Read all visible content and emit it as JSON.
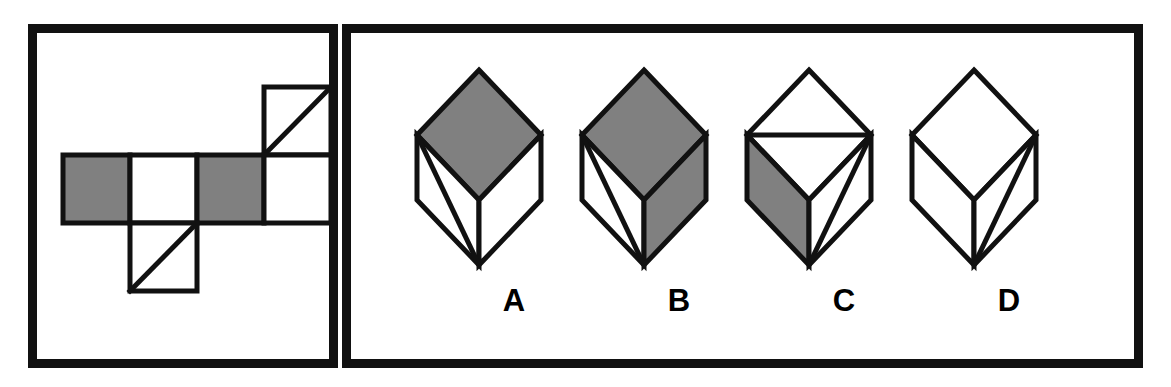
{
  "figure": {
    "type": "cube-folding-puzzle",
    "colors": {
      "ink": "#111111",
      "shaded_face": "#808080",
      "blank_face": "#ffffff",
      "background": "#ffffff"
    }
  },
  "left_panel": {
    "name": "cube-net",
    "grid": {
      "columns": 4,
      "rows": 3,
      "cell_size": 67
    },
    "cells": [
      {
        "col": 4,
        "row": 1,
        "fill": "white",
        "diagonal": "bottom-left-to-top-right"
      },
      {
        "col": 1,
        "row": 2,
        "fill": "shaded",
        "diagonal": "none"
      },
      {
        "col": 2,
        "row": 2,
        "fill": "white",
        "diagonal": "none"
      },
      {
        "col": 3,
        "row": 2,
        "fill": "shaded",
        "diagonal": "none"
      },
      {
        "col": 4,
        "row": 2,
        "fill": "white",
        "diagonal": "none"
      },
      {
        "col": 2,
        "row": 3,
        "fill": "white",
        "diagonal": "bottom-left-to-top-right"
      }
    ]
  },
  "right_panel": {
    "name": "answer-options",
    "options": [
      {
        "label": "A",
        "top_face": {
          "fill": "shaded",
          "diagonal": "none"
        },
        "left_face": {
          "fill": "white",
          "diagonal": "top-left-vertex-to-bottom-vertex"
        },
        "right_face": {
          "fill": "white",
          "diagonal": "none"
        }
      },
      {
        "label": "B",
        "top_face": {
          "fill": "shaded",
          "diagonal": "none"
        },
        "left_face": {
          "fill": "white",
          "diagonal": "top-left-vertex-to-bottom-vertex"
        },
        "right_face": {
          "fill": "shaded",
          "diagonal": "none"
        }
      },
      {
        "label": "C",
        "top_face": {
          "fill": "white",
          "diagonal": "left-vertex-to-right-vertex"
        },
        "left_face": {
          "fill": "shaded",
          "diagonal": "none"
        },
        "right_face": {
          "fill": "white",
          "diagonal": "top-right-vertex-to-bottom-vertex"
        }
      },
      {
        "label": "D",
        "top_face": {
          "fill": "white",
          "diagonal": "none"
        },
        "left_face": {
          "fill": "white",
          "diagonal": "none"
        },
        "right_face": {
          "fill": "white",
          "diagonal": "top-right-vertex-to-bottom-vertex"
        }
      }
    ]
  }
}
